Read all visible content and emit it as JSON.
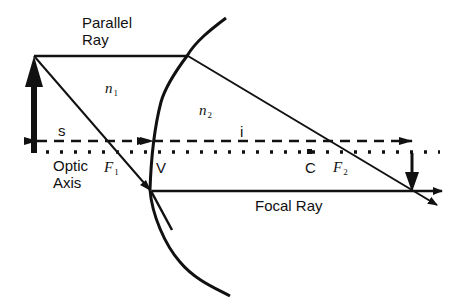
{
  "labels": {
    "parallel_ray_line1": "Parallel",
    "parallel_ray_line2": "Ray",
    "n1_symbol": "n",
    "n1_sub": "1",
    "n2_symbol": "n",
    "n2_sub": "2",
    "s": "s",
    "i": "i",
    "optic_axis_line1": "Optic",
    "optic_axis_line2": "Axis",
    "f1_symbol": "F",
    "f1_sub": "1",
    "vertex": "V",
    "center": "C",
    "f2_symbol": "F",
    "f2_sub": "2",
    "focal_ray": "Focal Ray"
  },
  "colors": {
    "ink": "#111111",
    "background": "#ffffff"
  }
}
